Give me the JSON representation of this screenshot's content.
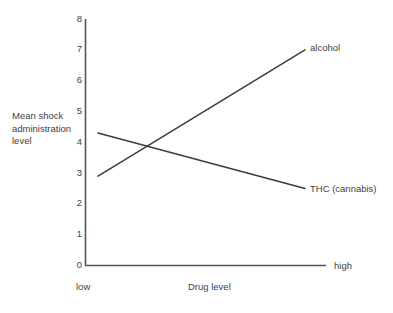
{
  "chart_data": {
    "type": "line",
    "title": "",
    "subtitle": "",
    "xlabel": "Drug level",
    "ylabel": "Mean shock administration level",
    "ylabel_lines": [
      "Mean shock",
      "administration",
      "level"
    ],
    "categories": [
      "low",
      "high"
    ],
    "x": [
      0,
      1
    ],
    "xlim": [
      0,
      1
    ],
    "ylim": [
      0,
      8
    ],
    "yticks": [
      0,
      1,
      2,
      3,
      4,
      5,
      6,
      7,
      8
    ],
    "ytick_labels": [
      "0",
      "1",
      "2",
      "3",
      "4",
      "5",
      "6",
      "7",
      "8"
    ],
    "xtick_labels": [
      "low",
      "high"
    ],
    "grid": false,
    "legend_position": "inline-right",
    "series": [
      {
        "name": "alcohol",
        "label": "alcohol",
        "color": "#3c3c3c",
        "values": [
          2.9,
          7.0
        ]
      },
      {
        "name": "THC (cannabis)",
        "label": "THC (cannabis)",
        "color": "#3c3c3c",
        "values": [
          4.3,
          2.5
        ]
      }
    ],
    "annotations": [
      {
        "text": "alcohol",
        "attached_to": "alcohol",
        "at": "right-end"
      },
      {
        "text": "THC (cannabis)",
        "attached_to": "THC (cannabis)",
        "at": "right-end"
      },
      {
        "text": "low",
        "attached_to": "x-axis",
        "at": "left-end"
      },
      {
        "text": "high",
        "attached_to": "x-axis",
        "at": "right-end"
      }
    ]
  },
  "style": {
    "axis_color": "#555555",
    "line_color": "#3c3c3c",
    "text_color": "#3f3f3f",
    "background": "#ffffff"
  }
}
